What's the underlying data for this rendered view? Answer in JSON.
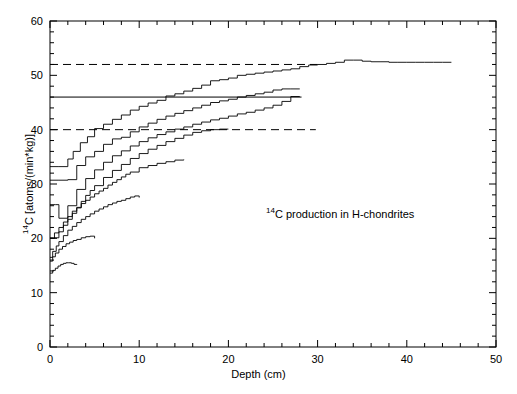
{
  "chart_data": {
    "type": "line",
    "title": "",
    "annotation": "14C  production in H-chondrites",
    "annotation_sup": "14",
    "annotation_rest": "C  production in H-chondrites",
    "xlabel_text": "Depth   (cm)",
    "ylabel_sup": "14",
    "ylabel_rest": "C  [atoms/(min*kg)]",
    "xlim": [
      0,
      50
    ],
    "ylim": [
      0,
      60
    ],
    "xticks": [
      0,
      10,
      20,
      30,
      40,
      50
    ],
    "xticklabels": [
      "0",
      "10",
      "20",
      "30",
      "40",
      "50"
    ],
    "xminor_step": 2,
    "yticks": [
      0,
      10,
      20,
      30,
      40,
      50,
      60
    ],
    "yticklabels": [
      "0",
      "10",
      "20",
      "30",
      "40",
      "50",
      "60"
    ],
    "yminor_step": 2,
    "grid": false,
    "legend": "none",
    "reference_lines": [
      {
        "name": "upper-dashed-52",
        "y": 52,
        "x_start": 0,
        "x_end": 30,
        "style": "dashed"
      },
      {
        "name": "solid-46",
        "y": 46,
        "x_start": 0,
        "x_end": 28.2,
        "style": "solid"
      },
      {
        "name": "lower-dashed-40",
        "y": 40,
        "x_start": 0,
        "x_end": 29.8,
        "style": "dashed"
      }
    ],
    "series": [
      {
        "name": "R-largest",
        "x": [
          0,
          1,
          2,
          2.6,
          3.4,
          4.2,
          5,
          6,
          7,
          8,
          9,
          10,
          11,
          12,
          13,
          14,
          15,
          16,
          17,
          18,
          19,
          20,
          21,
          22,
          23,
          24,
          25,
          26,
          27,
          28,
          29,
          30,
          31,
          32,
          33,
          34,
          35,
          36,
          37,
          38,
          39,
          40,
          41,
          42,
          43,
          44,
          45
        ],
        "y": [
          33.2,
          33.2,
          34.6,
          36.0,
          37.6,
          38.7,
          40.2,
          41.0,
          41.9,
          42.7,
          43.6,
          44.3,
          44.9,
          45.4,
          46.2,
          46.6,
          47.1,
          47.6,
          48.2,
          49.0,
          49.2,
          49.5,
          50.0,
          50.2,
          50.4,
          50.6,
          50.8,
          51.0,
          51.2,
          51.6,
          51.9,
          52.0,
          52.2,
          52.4,
          52.8,
          52.8,
          52.6,
          52.5,
          52.5,
          52.4,
          52.4,
          52.4,
          52.4,
          52.4,
          52.4,
          52.4,
          52.4
        ]
      },
      {
        "name": "R-second",
        "x": [
          0,
          1,
          2,
          3,
          4,
          5,
          6,
          7,
          8,
          9,
          10,
          11,
          12,
          13,
          14,
          15,
          16,
          17,
          18,
          19,
          20,
          21,
          22,
          23,
          24,
          25,
          26,
          27,
          28
        ],
        "y": [
          30.7,
          30.7,
          30.8,
          33.4,
          35.0,
          36.0,
          37.3,
          38.3,
          38.6,
          39.6,
          40.5,
          41.2,
          41.9,
          42.5,
          43.0,
          43.5,
          44.0,
          44.5,
          45.0,
          45.3,
          45.6,
          46.0,
          46.3,
          46.6,
          46.9,
          47.3,
          47.5,
          47.5,
          47.5
        ]
      },
      {
        "name": "R-third",
        "x": [
          0,
          0.6,
          1,
          2,
          3,
          4,
          5,
          6,
          7,
          8,
          9,
          10,
          11,
          12,
          13,
          14,
          15,
          16,
          17,
          18,
          19,
          20,
          21,
          22,
          23,
          24,
          25,
          26,
          27,
          28
        ],
        "y": [
          26.2,
          26.2,
          23.7,
          26.0,
          29.0,
          31.0,
          32.6,
          34.0,
          35.2,
          36.1,
          37.0,
          37.8,
          38.5,
          39.1,
          39.6,
          40.1,
          40.5,
          41.0,
          41.4,
          41.8,
          42.1,
          42.5,
          42.9,
          43.2,
          43.6,
          44.0,
          44.5,
          45.2,
          46.1,
          46.1
        ]
      },
      {
        "name": "R-fourth",
        "x": [
          0,
          0.4,
          1,
          1.5,
          2,
          2.5,
          3,
          3.5,
          4,
          4.5,
          5,
          6,
          7,
          8,
          9,
          10,
          11,
          12,
          13,
          14,
          15,
          16,
          17,
          18,
          19,
          20
        ],
        "y": [
          20.1,
          20.1,
          21.2,
          22.4,
          23.5,
          24.6,
          25.6,
          26.8,
          27.9,
          28.8,
          29.7,
          31.2,
          32.5,
          33.6,
          34.7,
          35.6,
          36.4,
          37.1,
          37.8,
          38.4,
          39.0,
          39.5,
          39.8,
          40.0,
          40.1,
          40.1
        ]
      },
      {
        "name": "R-fifth",
        "x": [
          0,
          0.5,
          1,
          1.5,
          2,
          2.5,
          3,
          3.5,
          4,
          4.5,
          5,
          5.5,
          6,
          6.5,
          7,
          7.5,
          8,
          8.5,
          9,
          10,
          11,
          12,
          13,
          14,
          15
        ],
        "y": [
          20.0,
          21.0,
          22.0,
          23.0,
          24.0,
          25.0,
          25.7,
          26.4,
          27.0,
          27.6,
          28.2,
          28.7,
          29.2,
          29.8,
          30.3,
          30.8,
          31.3,
          31.8,
          32.2,
          33.0,
          33.4,
          33.8,
          34.1,
          34.4,
          34.5
        ]
      },
      {
        "name": "R-sixth",
        "x": [
          0,
          0.3,
          0.7,
          1,
          1.5,
          2,
          2.5,
          3,
          3.5,
          4,
          4.5,
          5,
          5.5,
          6,
          6.5,
          7,
          7.5,
          8,
          8.5,
          9,
          9.5,
          10
        ],
        "y": [
          16.5,
          17.6,
          18.6,
          19.4,
          20.5,
          21.5,
          22.2,
          22.9,
          23.5,
          24.0,
          24.5,
          25.0,
          25.4,
          25.8,
          26.2,
          26.5,
          26.8,
          27.0,
          27.3,
          27.6,
          27.8,
          27.5
        ]
      },
      {
        "name": "R-seventh",
        "x": [
          0,
          0.3,
          0.6,
          1,
          1.4,
          1.8,
          2.2,
          2.6,
          3,
          3.5,
          4,
          4.5,
          5
        ],
        "y": [
          15.8,
          16.6,
          17.3,
          18.0,
          18.5,
          19.0,
          19.3,
          19.6,
          19.8,
          20.1,
          20.3,
          20.4,
          20.0
        ]
      },
      {
        "name": "R-smallest",
        "x": [
          0,
          0.3,
          0.6,
          0.9,
          1.2,
          1.5,
          1.8,
          2.1,
          2.4,
          2.7,
          3
        ],
        "y": [
          13.6,
          14.1,
          14.5,
          14.9,
          15.2,
          15.4,
          15.5,
          15.5,
          15.4,
          15.2,
          15.1
        ]
      }
    ]
  },
  "axis": {
    "x_label_text": "Depth   (cm)",
    "y_label_text": "C  [atoms/(min*kg)]",
    "y_label_sup": "14"
  }
}
